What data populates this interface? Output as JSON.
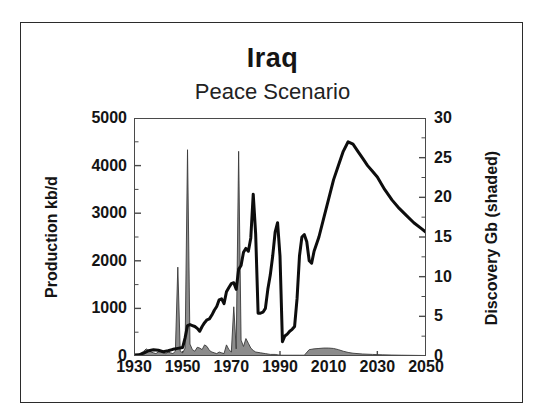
{
  "chart_data": {
    "type": "area",
    "title": "Iraq",
    "subtitle": "Peace Scenario",
    "xlabel": "",
    "ylabel": "Production kb/d",
    "ylabel_right": "Discovery Gb (shaded)",
    "xlim": [
      1930,
      2050
    ],
    "ylim": [
      0,
      5000
    ],
    "ylim_right": [
      0,
      30
    ],
    "xticks": [
      1930,
      1950,
      1970,
      1990,
      2010,
      2030,
      2050
    ],
    "yticks_left": [
      0,
      1000,
      2000,
      3000,
      4000,
      5000
    ],
    "yticks_right": [
      0,
      5,
      10,
      15,
      20,
      25,
      30
    ],
    "yticks_left_minor": [
      500,
      1500,
      2500,
      3500,
      4500
    ],
    "yticks_right_minor": [
      2.5,
      7.5,
      12.5,
      17.5,
      22.5,
      27.5
    ],
    "grid": false,
    "legend": "none",
    "series": [
      {
        "name": "Production kb/d",
        "axis": "left",
        "style": "line",
        "color": "#0d0d0d",
        "points": [
          [
            1930,
            20
          ],
          [
            1932,
            25
          ],
          [
            1934,
            60
          ],
          [
            1936,
            110
          ],
          [
            1938,
            130
          ],
          [
            1940,
            120
          ],
          [
            1942,
            90
          ],
          [
            1944,
            110
          ],
          [
            1946,
            140
          ],
          [
            1948,
            160
          ],
          [
            1950,
            180
          ],
          [
            1951,
            380
          ],
          [
            1952,
            640
          ],
          [
            1953,
            660
          ],
          [
            1954,
            640
          ],
          [
            1955,
            620
          ],
          [
            1956,
            580
          ],
          [
            1957,
            520
          ],
          [
            1958,
            620
          ],
          [
            1959,
            700
          ],
          [
            1960,
            760
          ],
          [
            1961,
            780
          ],
          [
            1962,
            860
          ],
          [
            1963,
            960
          ],
          [
            1964,
            1040
          ],
          [
            1965,
            1180
          ],
          [
            1966,
            1200
          ],
          [
            1967,
            1100
          ],
          [
            1968,
            1350
          ],
          [
            1969,
            1440
          ],
          [
            1970,
            1520
          ],
          [
            1971,
            1540
          ],
          [
            1972,
            1400
          ],
          [
            1973,
            1820
          ],
          [
            1974,
            1900
          ],
          [
            1975,
            2180
          ],
          [
            1976,
            2260
          ],
          [
            1977,
            2200
          ],
          [
            1978,
            2480
          ],
          [
            1979,
            3400
          ],
          [
            1980,
            2560
          ],
          [
            1981,
            900
          ],
          [
            1982,
            900
          ],
          [
            1983,
            920
          ],
          [
            1984,
            1000
          ],
          [
            1985,
            1400
          ],
          [
            1986,
            1700
          ],
          [
            1987,
            2100
          ],
          [
            1988,
            2600
          ],
          [
            1989,
            2800
          ],
          [
            1990,
            2100
          ],
          [
            1991,
            300
          ],
          [
            1992,
            420
          ],
          [
            1993,
            460
          ],
          [
            1994,
            520
          ],
          [
            1995,
            560
          ],
          [
            1996,
            620
          ],
          [
            1997,
            1200
          ],
          [
            1998,
            2100
          ],
          [
            1999,
            2500
          ],
          [
            2000,
            2550
          ],
          [
            2001,
            2400
          ],
          [
            2002,
            2000
          ],
          [
            2003,
            1950
          ],
          [
            2004,
            2200
          ],
          [
            2006,
            2500
          ],
          [
            2008,
            2900
          ],
          [
            2010,
            3300
          ],
          [
            2012,
            3700
          ],
          [
            2014,
            4000
          ],
          [
            2016,
            4300
          ],
          [
            2018,
            4500
          ],
          [
            2020,
            4450
          ],
          [
            2022,
            4300
          ],
          [
            2024,
            4150
          ],
          [
            2026,
            4000
          ],
          [
            2028,
            3880
          ],
          [
            2030,
            3760
          ],
          [
            2033,
            3500
          ],
          [
            2036,
            3280
          ],
          [
            2039,
            3100
          ],
          [
            2042,
            2950
          ],
          [
            2045,
            2800
          ],
          [
            2048,
            2680
          ],
          [
            2050,
            2600
          ]
        ]
      },
      {
        "name": "Discovery Gb (shaded)",
        "axis": "right",
        "style": "area",
        "color": "#8c8c8c",
        "points": [
          [
            1930,
            0.1
          ],
          [
            1932,
            0.2
          ],
          [
            1934,
            0.6
          ],
          [
            1935,
            0.9
          ],
          [
            1936,
            0.7
          ],
          [
            1937,
            0.5
          ],
          [
            1938,
            0.4
          ],
          [
            1939,
            0.3
          ],
          [
            1940,
            0.5
          ],
          [
            1941,
            0.6
          ],
          [
            1942,
            0.4
          ],
          [
            1943,
            0.3
          ],
          [
            1944,
            0.5
          ],
          [
            1945,
            0.4
          ],
          [
            1946,
            0.3
          ],
          [
            1947,
            0.6
          ],
          [
            1948,
            11.2
          ],
          [
            1949,
            0.6
          ],
          [
            1950,
            0.4
          ],
          [
            1951,
            1.0
          ],
          [
            1952,
            26.0
          ],
          [
            1953,
            1.5
          ],
          [
            1954,
            0.8
          ],
          [
            1955,
            0.6
          ],
          [
            1956,
            1.1
          ],
          [
            1957,
            1.0
          ],
          [
            1958,
            0.8
          ],
          [
            1959,
            1.4
          ],
          [
            1960,
            1.2
          ],
          [
            1961,
            0.7
          ],
          [
            1962,
            0.5
          ],
          [
            1963,
            0.4
          ],
          [
            1964,
            0.3
          ],
          [
            1965,
            0.5
          ],
          [
            1966,
            0.4
          ],
          [
            1967,
            0.3
          ],
          [
            1968,
            1.4
          ],
          [
            1969,
            0.8
          ],
          [
            1970,
            0.5
          ],
          [
            1971,
            6.2
          ],
          [
            1972,
            0.9
          ],
          [
            1973,
            25.8
          ],
          [
            1974,
            2.0
          ],
          [
            1975,
            1.2
          ],
          [
            1976,
            2.2
          ],
          [
            1977,
            1.6
          ],
          [
            1978,
            1.0
          ],
          [
            1979,
            0.7
          ],
          [
            1980,
            0.5
          ],
          [
            1982,
            0.4
          ],
          [
            1984,
            0.3
          ],
          [
            1986,
            0.2
          ],
          [
            1988,
            0.2
          ],
          [
            1990,
            0.1
          ],
          [
            1992,
            0.1
          ],
          [
            1995,
            0.1
          ],
          [
            1998,
            0.1
          ],
          [
            2000,
            0.1
          ],
          [
            2002,
            0.8
          ],
          [
            2004,
            0.9
          ],
          [
            2006,
            0.95
          ],
          [
            2008,
            1.0
          ],
          [
            2010,
            1.0
          ],
          [
            2012,
            0.95
          ],
          [
            2014,
            0.8
          ],
          [
            2016,
            0.6
          ],
          [
            2018,
            0.45
          ],
          [
            2020,
            0.35
          ],
          [
            2024,
            0.25
          ],
          [
            2028,
            0.2
          ],
          [
            2032,
            0.15
          ],
          [
            2036,
            0.12
          ],
          [
            2040,
            0.1
          ],
          [
            2045,
            0.08
          ],
          [
            2050,
            0.06
          ]
        ]
      }
    ]
  },
  "figure": {
    "title": "Iraq",
    "subtitle": "Peace Scenario",
    "ylabel_left": "Production kb/d",
    "ylabel_right": "Discovery Gb (shaded)",
    "xticklabels": [
      "1930",
      "1950",
      "1970",
      "1990",
      "2010",
      "2030",
      "2050"
    ],
    "yticklabels_left": [
      "0",
      "1000",
      "2000",
      "3000",
      "4000",
      "5000"
    ],
    "yticklabels_right": [
      "0",
      "5",
      "10",
      "15",
      "20",
      "25",
      "30"
    ],
    "colors": {
      "line": "#0d0d0d",
      "shaded": "#8c8c8c",
      "frame": "#2b2b2b",
      "axis": "#4a4a4a",
      "background": "#ffffff",
      "text": "#141414"
    }
  }
}
